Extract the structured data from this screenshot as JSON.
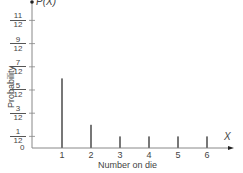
{
  "chart_data": {
    "type": "bar",
    "title": "",
    "xlabel": "Number on die",
    "ylabel": "Probability",
    "x_axis_symbol": "X",
    "y_axis_symbol": "P(X)",
    "categories": [
      "1",
      "2",
      "3",
      "4",
      "5",
      "6"
    ],
    "values": [
      0.5,
      0.1667,
      0.0833,
      0.0833,
      0.0833,
      0.0833
    ],
    "values_as_fractions": [
      "6/12",
      "2/12",
      "1/12",
      "1/12",
      "1/12",
      "1/12"
    ],
    "y_ticks": [
      {
        "num": "1",
        "den": "12",
        "value": 0.0833
      },
      {
        "num": "3",
        "den": "12",
        "value": 0.25
      },
      {
        "num": "5",
        "den": "12",
        "value": 0.4167
      },
      {
        "num": "7",
        "den": "12",
        "value": 0.5833
      },
      {
        "num": "9",
        "den": "12",
        "value": 0.75
      },
      {
        "num": "11",
        "den": "12",
        "value": 0.9167
      }
    ],
    "y_zero_label": "0",
    "ylim": [
      0,
      1
    ],
    "grid": false,
    "legend": null,
    "bar_color": "#777777"
  }
}
